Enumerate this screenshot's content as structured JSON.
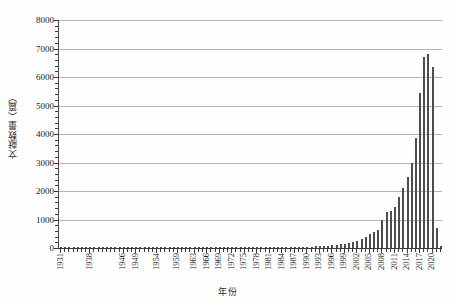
{
  "chart_data": {
    "type": "bar",
    "title": "",
    "xlabel": "年份",
    "ylabel": "文献数量（篇）",
    "ylim": [
      0,
      8000
    ],
    "ytick_values": [
      0,
      1000,
      2000,
      3000,
      4000,
      5000,
      6000,
      7000,
      8000
    ],
    "ytick_labels": [
      "0",
      "1000",
      "2000",
      "3000",
      "4000",
      "5000",
      "6000",
      "7000",
      "8000"
    ],
    "grid": true,
    "legend": "none",
    "xtick_labels": [
      "1931",
      "1938",
      "1946",
      "1949",
      "1954",
      "1959",
      "1963",
      "1966",
      "1969",
      "1972",
      "1975",
      "1978",
      "1981",
      "1984",
      "1987",
      "1990",
      "1993",
      "1996",
      "1999",
      "2002",
      "2005",
      "2008",
      "2011",
      "2014",
      "2017",
      "2020"
    ],
    "categories": [
      "1931",
      "1932",
      "1933",
      "1934",
      "1935",
      "1936",
      "1937",
      "1938",
      "1939",
      "1940",
      "1941",
      "1942",
      "1943",
      "1944",
      "1945",
      "1946",
      "1947",
      "1948",
      "1949",
      "1950",
      "1951",
      "1952",
      "1953",
      "1954",
      "1955",
      "1956",
      "1957",
      "1958",
      "1959",
      "1960",
      "1961",
      "1962",
      "1963",
      "1964",
      "1965",
      "1966",
      "1967",
      "1968",
      "1969",
      "1970",
      "1971",
      "1972",
      "1973",
      "1974",
      "1975",
      "1976",
      "1977",
      "1978",
      "1979",
      "1980",
      "1981",
      "1982",
      "1983",
      "1984",
      "1985",
      "1986",
      "1987",
      "1988",
      "1989",
      "1990",
      "1991",
      "1992",
      "1993",
      "1994",
      "1995",
      "1996",
      "1997",
      "1998",
      "1999",
      "2000",
      "2001",
      "2002",
      "2003",
      "2004",
      "2005",
      "2006",
      "2007",
      "2008",
      "2009",
      "2010",
      "2011",
      "2012",
      "2013",
      "2014",
      "2015",
      "2016",
      "2017",
      "2018",
      "2019",
      "2020",
      "2021",
      "2022"
    ],
    "values": [
      5,
      4,
      5,
      5,
      6,
      5,
      4,
      6,
      5,
      4,
      4,
      5,
      5,
      6,
      5,
      6,
      7,
      6,
      8,
      7,
      6,
      7,
      8,
      9,
      8,
      10,
      9,
      11,
      10,
      12,
      11,
      13,
      12,
      14,
      13,
      15,
      14,
      13,
      16,
      15,
      14,
      17,
      16,
      18,
      17,
      19,
      18,
      20,
      22,
      21,
      24,
      23,
      26,
      28,
      30,
      32,
      35,
      38,
      42,
      46,
      52,
      58,
      66,
      74,
      85,
      96,
      110,
      128,
      150,
      180,
      215,
      260,
      320,
      400,
      500,
      560,
      620,
      980,
      1260,
      1300,
      1450,
      1800,
      2100,
      2480,
      3000,
      3850,
      5450,
      6700,
      6800,
      6350,
      700,
      60
    ]
  }
}
